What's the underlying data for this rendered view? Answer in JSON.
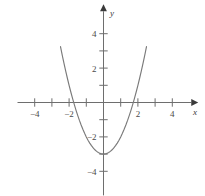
{
  "figure": {
    "name": "parabola-graph",
    "background_color": "#ffffff",
    "curve_color": "#7a7a7a",
    "axis_color": "#6e6e6e",
    "label_color": "#4a4a4a"
  },
  "axes": {
    "x_axis_label": "x",
    "y_axis_label": "y",
    "x_ticks": [
      -4,
      -3,
      -2,
      -1,
      1,
      2,
      3,
      4
    ],
    "y_ticks": [
      -4,
      -3,
      -2,
      -1,
      1,
      2,
      3,
      4
    ],
    "x_tick_labels": [
      {
        "value": -4,
        "text": "−4"
      },
      {
        "value": -2,
        "text": "−2"
      },
      {
        "value": 2,
        "text": "2"
      },
      {
        "value": 4,
        "text": "4"
      }
    ],
    "y_tick_labels": [
      {
        "value": 4,
        "text": "4"
      },
      {
        "value": 2,
        "text": "2"
      },
      {
        "value": -2,
        "text": "−2"
      },
      {
        "value": -4,
        "text": "−4"
      }
    ],
    "x_arrow": "right-arrow",
    "y_arrow": "up-arrow"
  },
  "chart_data": {
    "type": "line",
    "title": "",
    "xlabel": "x",
    "ylabel": "y",
    "xlim": [
      -5,
      5
    ],
    "ylim": [
      -5,
      5
    ],
    "grid": false,
    "legend": false,
    "series": [
      {
        "name": "parabola",
        "equation": "y = x^2 - 3",
        "vertex": [
          0,
          -3
        ],
        "x_intercepts": [
          -1.73,
          1.73
        ],
        "y_intercept": -3,
        "opens": "up",
        "x": [
          -2.5,
          -2.4,
          -2.3,
          -2.2,
          -2.1,
          -2.0,
          -1.9,
          -1.8,
          -1.7,
          -1.6,
          -1.5,
          -1.4,
          -1.3,
          -1.2,
          -1.1,
          -1.0,
          -0.9,
          -0.8,
          -0.7,
          -0.6,
          -0.5,
          -0.4,
          -0.3,
          -0.2,
          -0.1,
          0.0,
          0.1,
          0.2,
          0.3,
          0.4,
          0.5,
          0.6,
          0.7,
          0.8,
          0.9,
          1.0,
          1.1,
          1.2,
          1.3,
          1.4,
          1.5,
          1.6,
          1.7,
          1.8,
          1.9,
          2.0,
          2.1,
          2.2,
          2.3,
          2.4,
          2.5
        ],
        "y": [
          3.25,
          2.76,
          2.29,
          1.84,
          1.41,
          1.0,
          0.61,
          0.24,
          -0.11,
          -0.44,
          -0.75,
          -1.04,
          -1.31,
          -1.56,
          -1.79,
          -2.0,
          -2.19,
          -2.36,
          -2.51,
          -2.64,
          -2.75,
          -2.84,
          -2.91,
          -2.96,
          -2.99,
          -3.0,
          -2.99,
          -2.96,
          -2.91,
          -2.84,
          -2.75,
          -2.64,
          -2.51,
          -2.36,
          -2.19,
          -2.0,
          -1.79,
          -1.56,
          -1.31,
          -1.04,
          -0.75,
          -0.44,
          -0.11,
          0.24,
          0.61,
          1.0,
          1.41,
          1.84,
          2.29,
          2.76,
          3.25
        ]
      }
    ]
  }
}
